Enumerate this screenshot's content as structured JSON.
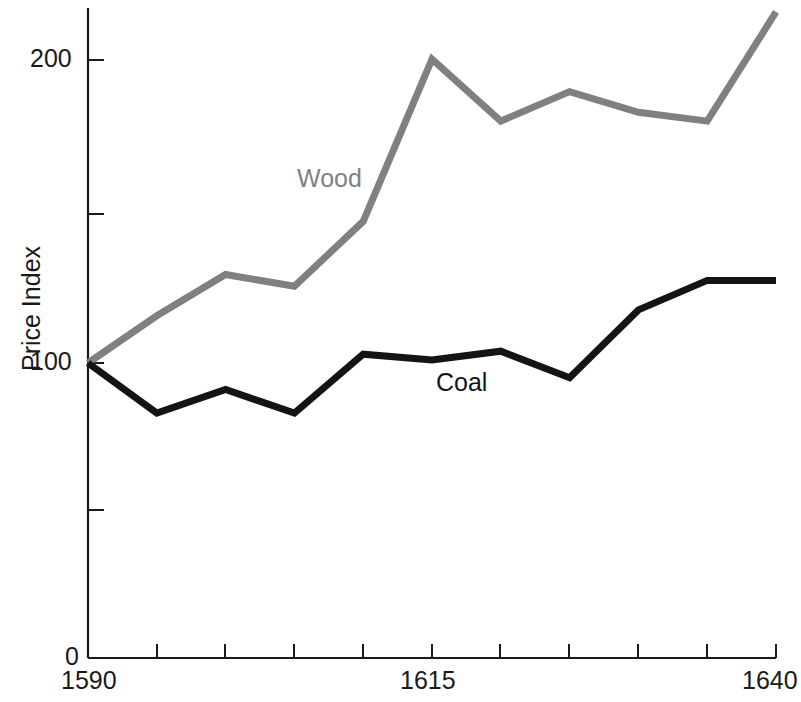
{
  "chart_data": {
    "type": "line",
    "title": "",
    "xlabel": "",
    "ylabel": "Price Index",
    "xlim": [
      1590,
      1640
    ],
    "ylim": [
      0,
      220
    ],
    "grid": false,
    "legend_position": "inline-annotations",
    "x": [
      1590,
      1595,
      1600,
      1605,
      1610,
      1615,
      1620,
      1625,
      1630,
      1635,
      1640
    ],
    "series": [
      {
        "name": "Wood",
        "color": "#808080",
        "values": [
          100,
          116,
          130,
          126,
          148,
          203,
          182,
          192,
          185,
          182,
          219
        ]
      },
      {
        "name": "Coal",
        "color": "#141414",
        "values": [
          100,
          83,
          91,
          83,
          103,
          101,
          104,
          95,
          118,
          128,
          128
        ]
      }
    ],
    "y_ticks": [
      0,
      50,
      100,
      150,
      200
    ],
    "y_tick_labels": [
      "0",
      "",
      "100",
      "",
      "200"
    ],
    "x_ticks": [
      1590,
      1595,
      1600,
      1605,
      1610,
      1615,
      1620,
      1625,
      1630,
      1635,
      1640
    ],
    "x_tick_labels": [
      "1590",
      "",
      "",
      "",
      "",
      "1615",
      "",
      "",
      "",
      "",
      "1640"
    ]
  },
  "axes": {
    "y_title": "Price Index",
    "y_labels": {
      "top": "200",
      "middle": "100",
      "bottom": "0"
    },
    "x_labels": {
      "start": "1590",
      "middle": "1615",
      "end": "1640"
    }
  },
  "annotations": {
    "wood_label": "Wood",
    "coal_label": "Coal"
  },
  "colors": {
    "wood": "#808080",
    "coal": "#141414",
    "axis": "#1a1a1a",
    "background": "#ffffff"
  }
}
